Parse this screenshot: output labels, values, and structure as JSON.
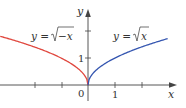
{
  "chart_data": {
    "type": "line",
    "title": "",
    "xlabel": "x",
    "ylabel": "y",
    "x_ticks": [
      -3,
      -2,
      -1,
      0,
      1,
      2
    ],
    "x_tick_labels": [
      "0",
      "1"
    ],
    "y_ticks": [
      1,
      2
    ],
    "y_tick_labels": [
      "1"
    ],
    "xlim": [
      -3.25,
      3.2
    ],
    "ylim": [
      0,
      2.8
    ],
    "grid": false,
    "legend": "inline curve labels",
    "series": [
      {
        "name": "y = √−x",
        "color": "#e0483f",
        "x": [
          -3.25,
          -3,
          -2,
          -1,
          -0.5,
          -0.1,
          0
        ],
        "y": [
          1.803,
          1.732,
          1.414,
          1.0,
          0.707,
          0.316,
          0
        ]
      },
      {
        "name": "y = √x",
        "color": "#3556b0",
        "x": [
          0,
          0.1,
          0.5,
          1,
          2,
          2.95
        ],
        "y": [
          0,
          0.316,
          0.707,
          1.0,
          1.414,
          1.718
        ]
      }
    ],
    "annotations": [
      {
        "text": "y = √−x",
        "near": "left curve"
      },
      {
        "text": "y = √x",
        "near": "right curve"
      }
    ]
  },
  "labels": {
    "y_axis": "y",
    "x_axis": "x",
    "origin": "0",
    "x_one": "1",
    "y_one": "1",
    "left_eq_prefix": "y = ",
    "left_eq_radicand": "−x",
    "right_eq_prefix": "y = ",
    "right_eq_radicand": "x"
  },
  "colors": {
    "axis": "#444444",
    "left_curve": "#e0483f",
    "right_curve": "#3556b0"
  }
}
